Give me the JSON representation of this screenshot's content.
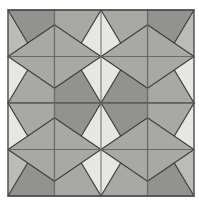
{
  "figure": {
    "title": "Four-Pointed Star Tiling Pattern",
    "canvas": {
      "width": 199,
      "height": 206,
      "background": "#ffffff"
    },
    "bounds": {
      "x": 8,
      "y": 10,
      "width": 186,
      "height": 186
    },
    "center": {
      "x": 101,
      "y": 103
    }
  },
  "palette": {
    "background": "#ffffff",
    "square_light": "#e6e6e3",
    "square_medium": "#bbbbb8",
    "star_fill": "#a8a8a5",
    "star_fill_dark": "#929290",
    "outline": "#3a3a3a",
    "grid_line": "#6a6a68",
    "border": "#4a4a4a"
  },
  "geometry": {
    "blocks_across": 2,
    "blocks_down": 2,
    "cells_across": 4,
    "cells_down": 4,
    "block_size": 93,
    "cell_size": 46.5,
    "star_points": 4,
    "outline_width": 1.1,
    "grid_width": 1.0,
    "border_width": 1.4
  },
  "checkerboard": {
    "note": "Each block is split into four cells; diagonal cells share a tone.",
    "tones": [
      [
        "medium",
        "light",
        "light",
        "medium"
      ],
      [
        "light",
        "light",
        "light",
        "light"
      ],
      [
        "light",
        "light",
        "light",
        "light"
      ],
      [
        "medium",
        "light",
        "light",
        "medium"
      ]
    ]
  },
  "blocks": [
    {
      "name": "top-left-star",
      "col": 0,
      "row": 0,
      "flip_x": false,
      "flip_y": false
    },
    {
      "name": "top-right-star",
      "col": 1,
      "row": 0,
      "flip_x": true,
      "flip_y": false
    },
    {
      "name": "bottom-left-star",
      "col": 0,
      "row": 1,
      "flip_x": false,
      "flip_y": true
    },
    {
      "name": "bottom-right-star",
      "col": 1,
      "row": 1,
      "flip_x": true,
      "flip_y": true
    }
  ],
  "star_motif": {
    "description": "Four elongated triangles radiating from the block corners toward two interior nodes, crossing near the block center to form an X-shaped star.",
    "node_offset_ratio": 0.34,
    "arm_count": 4
  }
}
